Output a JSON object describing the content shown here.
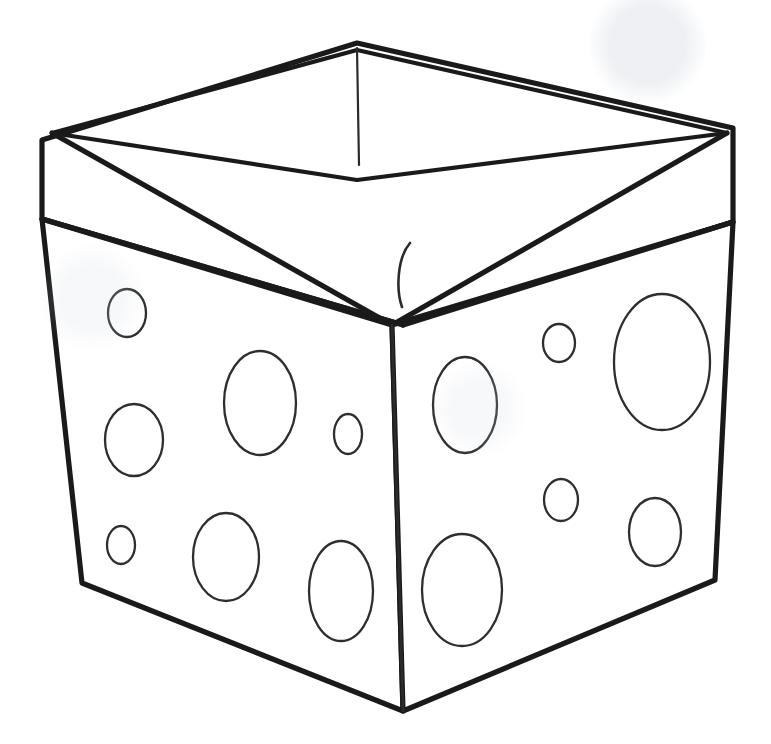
{
  "document": {
    "title": "Polka Dot Storage Box",
    "kind": "line-art-coloring-page",
    "width": 771,
    "height": 744,
    "background_color": "#ffffff",
    "stroke_color": "#1a1a1a",
    "dot_stroke_color": "#2e2e2e",
    "visible_text": ""
  },
  "artwork": {
    "subject": "open fabric storage box with folded rim and polka dots",
    "viewpoint": "three-quarter view from above, front corner facing viewer",
    "parts": [
      {
        "name": "rim-band",
        "label": "Folded rim band"
      },
      {
        "name": "inner-opening",
        "label": "Box interior opening"
      },
      {
        "name": "left-face",
        "label": "Left side panel"
      },
      {
        "name": "right-face",
        "label": "Right side panel"
      },
      {
        "name": "front-edge",
        "label": "Front vertical corner edge"
      },
      {
        "name": "rim-fold-detail",
        "label": "Rim fold crease at front corner"
      },
      {
        "name": "inner-seam",
        "label": "Interior back corner seam"
      }
    ],
    "shapes": {
      "rim_outer": "M 42,140 L 357,43 L 733,128 L 733,222 L 403,325 L 42,219 Z",
      "rim_inner_top": "M 52,133 L 357,50 L 727,133",
      "opening_back_left": "M 52,133 L 357,180",
      "opening_back_right": "M 727,133 L 357,180",
      "opening_front_left": "M 52,133 L 392,325",
      "opening_front_right": "M 727,133 L 392,325",
      "rim_bottom_left": "M 42,219 L 403,325",
      "rim_bottom_right": "M 403,325 L 733,222",
      "body_left": "M 42,219 L 82,583 L 403,711 L 392,325 Z",
      "body_right": "M 392,325 L 403,711 L 715,580 L 733,222 Z",
      "front_edge": "M 392,325 L 403,711",
      "inner_seam": "M 357,48 L 359,165",
      "rim_fold": "M 410,243 C 397,258 396,290 402,307"
    },
    "dots": {
      "left_face": [
        {
          "cx": 127,
          "cy": 313,
          "rx": 19,
          "ry": 24,
          "size": "small"
        },
        {
          "cx": 134,
          "cy": 440,
          "rx": 29,
          "ry": 36,
          "size": "medium"
        },
        {
          "cx": 260,
          "cy": 403,
          "rx": 36,
          "ry": 52,
          "size": "large"
        },
        {
          "cx": 348,
          "cy": 434,
          "rx": 14,
          "ry": 20,
          "size": "small"
        },
        {
          "cx": 121,
          "cy": 545,
          "rx": 14,
          "ry": 19,
          "size": "small"
        },
        {
          "cx": 226,
          "cy": 557,
          "rx": 33,
          "ry": 44,
          "size": "medium"
        },
        {
          "cx": 341,
          "cy": 591,
          "rx": 32,
          "ry": 50,
          "size": "medium"
        }
      ],
      "right_face": [
        {
          "cx": 465,
          "cy": 405,
          "rx": 32,
          "ry": 48,
          "size": "medium"
        },
        {
          "cx": 559,
          "cy": 343,
          "rx": 16,
          "ry": 19,
          "size": "small"
        },
        {
          "cx": 662,
          "cy": 362,
          "rx": 48,
          "ry": 68,
          "size": "large"
        },
        {
          "cx": 561,
          "cy": 500,
          "rx": 17,
          "ry": 21,
          "size": "small"
        },
        {
          "cx": 462,
          "cy": 590,
          "rx": 40,
          "ry": 56,
          "size": "large"
        },
        {
          "cx": 655,
          "cy": 532,
          "rx": 26,
          "ry": 34,
          "size": "medium"
        }
      ],
      "counts": {
        "left_face_total": 7,
        "right_face_total": 6,
        "total": 13
      }
    }
  }
}
